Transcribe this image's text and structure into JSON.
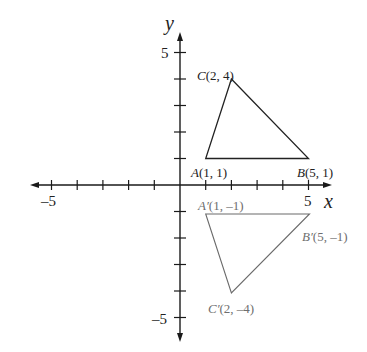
{
  "diagram": {
    "axes": {
      "x_label": "x",
      "y_label": "y",
      "x_range": [
        -5,
        5
      ],
      "y_range": [
        -5,
        5
      ],
      "x_tick_labels": [
        "-5",
        "5"
      ],
      "y_tick_labels": [
        "5",
        "-5"
      ],
      "x_tick_label_neg": "–5",
      "x_tick_label_pos": "5",
      "y_tick_label_pos": "5",
      "y_tick_label_neg": "–5"
    },
    "original_triangle": {
      "vertices": [
        {
          "name": "A",
          "x": 1,
          "y": 1,
          "label_name": "A",
          "label_coords": "(1, 1)"
        },
        {
          "name": "B",
          "x": 5,
          "y": 1,
          "label_name": "B",
          "label_coords": "(5, 1)"
        },
        {
          "name": "C",
          "x": 2,
          "y": 4,
          "label_name": "C",
          "label_coords": "(2, 4)"
        }
      ],
      "color": "#222222"
    },
    "image_triangle": {
      "vertices": [
        {
          "name": "A'",
          "x": 1,
          "y": -1,
          "label_name": "A′",
          "label_coords": "(1, –1)"
        },
        {
          "name": "B'",
          "x": 5,
          "y": -1,
          "label_name": "B′",
          "label_coords": "(5, –1)"
        },
        {
          "name": "C'",
          "x": 2,
          "y": -4,
          "label_name": "C′",
          "label_coords": "(2, –4)"
        }
      ],
      "color": "#6a6a6a"
    }
  }
}
